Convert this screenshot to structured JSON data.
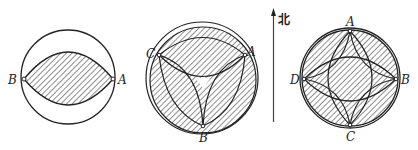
{
  "north_label": "北",
  "figures": [
    {
      "id": "figure-1",
      "points": [
        {
          "label": "B",
          "x": 24,
          "y": 79
        },
        {
          "label": "A",
          "x": 113,
          "y": 79
        }
      ],
      "description": "Circle with shaded lens region between B and A"
    },
    {
      "id": "figure-2",
      "points": [
        {
          "label": "C",
          "x": 159,
          "y": 54
        },
        {
          "label": "A",
          "x": 245,
          "y": 54
        },
        {
          "label": "B",
          "x": 203,
          "y": 126
        }
      ],
      "description": "Circle with three lens arcs meeting near center; mostly shaded except a small central triangle"
    },
    {
      "id": "figure-3",
      "points": [
        {
          "label": "A",
          "x": 350,
          "y": 30
        },
        {
          "label": "B",
          "x": 397,
          "y": 79
        },
        {
          "label": "C",
          "x": 350,
          "y": 125
        },
        {
          "label": "D",
          "x": 305,
          "y": 79
        }
      ],
      "description": "Circle with four-way lens arcs forming a star; whole disc shaded"
    }
  ],
  "colors": {
    "stroke": "#222222",
    "hatch": "#333333",
    "background": "#ffffff"
  }
}
